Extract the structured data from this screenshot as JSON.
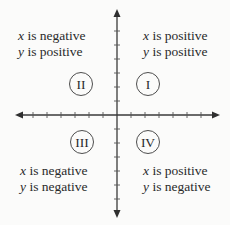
{
  "diagram": {
    "axes": {
      "x_axis": "horizontal",
      "y_axis": "vertical",
      "arrows": [
        "left",
        "right",
        "up",
        "down"
      ]
    },
    "quadrants": [
      {
        "numeral": "I",
        "x_var": "x",
        "x_text": " is positive",
        "y_var": "y",
        "y_text": " is positive"
      },
      {
        "numeral": "II",
        "x_var": "x",
        "x_text": " is negative",
        "y_var": "y",
        "y_text": " is positive"
      },
      {
        "numeral": "III",
        "x_var": "x",
        "x_text": " is negative",
        "y_var": "y",
        "y_text": " is negative"
      },
      {
        "numeral": "IV",
        "x_var": "x",
        "x_text": " is positive",
        "y_var": "y",
        "y_text": " is negative"
      }
    ],
    "colors": {
      "background": "#fbfbfa",
      "ink": "#2a2a2a"
    }
  }
}
